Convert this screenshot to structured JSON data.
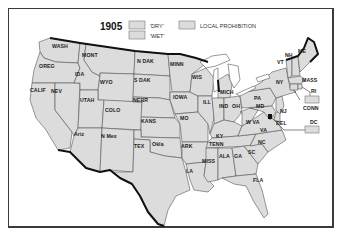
{
  "map": {
    "title": "1905",
    "legend": {
      "items": [
        {
          "key": "dry",
          "label": "'DRY'",
          "color": "#dcdcdc"
        },
        {
          "key": "wet",
          "label": "'WET'",
          "color": "#dcdcdc"
        },
        {
          "key": "local",
          "label": "LOCAL PROHIBITION",
          "color": "#dcdcdc"
        }
      ]
    },
    "states": {
      "wash": "WASH",
      "oreg": "OREG",
      "calif": "CALIF",
      "nev": "NEV",
      "ida": "IDA",
      "mont": "MONT",
      "wyo": "WYO",
      "utah": "UTAH",
      "ariz": "Ariz",
      "colo": "COLO",
      "nmex": "N Mex",
      "ndak": "N DAK",
      "sdak": "S DAK",
      "nebr": "NEBR",
      "kans": "KANS",
      "okla": "Okla",
      "tex": "TEX",
      "minn": "MINN",
      "iowa": "IOWA",
      "mo": "MO",
      "ark": "ARK",
      "la": "LA",
      "wis": "WIS",
      "ill": "ILL",
      "mich": "MICH",
      "ind": "IND",
      "oh": "OH",
      "ky": "KY",
      "tenn": "TENN",
      "miss": "MISS",
      "ala": "ALA",
      "ga": "GA",
      "fla": "FLA",
      "sc": "SC",
      "nc": "NC",
      "va": "VA",
      "wva": "W VA",
      "pa": "PA",
      "ny": "NY",
      "vt": "VT",
      "nh": "NH",
      "me": "ME",
      "mass": "MASS",
      "ri": "RI",
      "conn": "CONN",
      "nj": "NJ",
      "del": "DEL",
      "md": "MD",
      "dc": "DC"
    }
  }
}
